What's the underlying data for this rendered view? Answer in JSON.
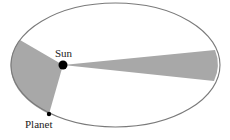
{
  "diagram": {
    "labels": {
      "sun": "Sun",
      "planet": "Planet"
    },
    "colors": {
      "orbit_stroke": "#7a7a7a",
      "sector_fill": "#a8a8a8",
      "sun_fill": "#000000",
      "planet_fill": "#000000",
      "background": "#ffffff"
    },
    "orbit": {
      "cx": 115.5,
      "cy": 65,
      "rx": 104.5,
      "ry": 62
    },
    "sun": {
      "x": 63,
      "y": 65,
      "r": 4.5
    },
    "planet": {
      "x": 49,
      "y": 114,
      "r": 2.2
    },
    "sectors": [
      {
        "name": "near-perihelion-sector",
        "from": [
          20,
          40
        ],
        "to": [
          49,
          114
        ]
      },
      {
        "name": "near-aphelion-sector",
        "from": [
          215,
          50
        ],
        "to": [
          214,
          81
        ]
      }
    ]
  }
}
